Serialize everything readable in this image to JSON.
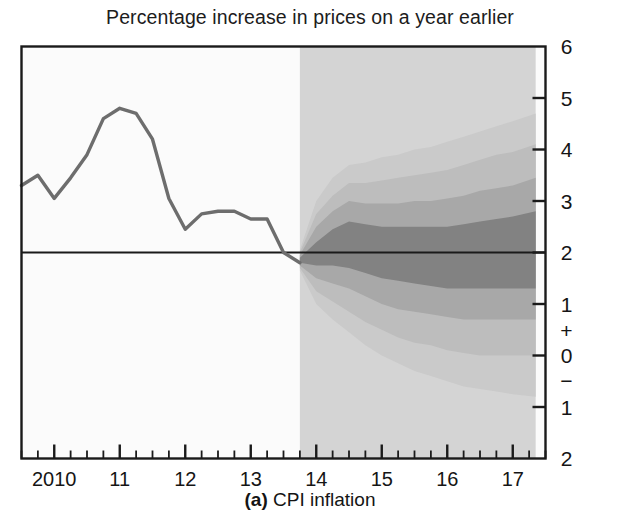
{
  "chart_title": "Percentage increase in prices on a year earlier",
  "caption": {
    "letter": "(a)",
    "label": "CPI inflation"
  },
  "colors": {
    "frame": "#1a1a1a",
    "history_line": "#6d6d6d",
    "target_line": "#1a1a1a",
    "forecast_bg": "#d4d4d4",
    "band_1": "#828282",
    "band_2": "#a8a8a8",
    "band_3": "#bdbdbd",
    "band_4": "#cacaca",
    "band_5": "#d2d2d2",
    "plot_bg": "#fbfbfb"
  },
  "chart_data": {
    "type": "area",
    "title": "Percentage increase in prices on a year earlier",
    "subtitle": "(a) CPI inflation",
    "xlabel": "",
    "ylabel": "",
    "grid": false,
    "legend": "none",
    "ylim": [
      -2,
      6
    ],
    "xlim": [
      2009.5,
      2017.5
    ],
    "ytick_labels": [
      "6",
      "5",
      "4",
      "3",
      "2",
      "1",
      "+",
      "0",
      "−",
      "1",
      "2"
    ],
    "ytick_values": [
      6,
      5,
      4,
      3,
      2,
      1,
      null,
      0,
      null,
      -1,
      -2
    ],
    "xtick_labels": [
      "2010",
      "11",
      "12",
      "13",
      "14",
      "15",
      "16",
      "17"
    ],
    "xtick_values": [
      2010,
      2011,
      2012,
      2013,
      2014,
      2015,
      2016,
      2017
    ],
    "minor_tick_interval_years": 0.25,
    "target_line_value": 2.0,
    "forecast_start_x": 2013.75,
    "forecast_shade_end_x": 2017.35,
    "history": {
      "name": "CPI inflation (outturn)",
      "x": [
        2009.5,
        2009.75,
        2010.0,
        2010.25,
        2010.5,
        2010.75,
        2011.0,
        2011.25,
        2011.5,
        2011.75,
        2012.0,
        2012.25,
        2012.5,
        2012.75,
        2013.0,
        2013.25,
        2013.5,
        2013.75
      ],
      "y": [
        3.3,
        3.5,
        3.05,
        3.45,
        3.9,
        4.6,
        4.8,
        4.7,
        4.2,
        3.05,
        2.45,
        2.75,
        2.8,
        2.8,
        2.65,
        2.65,
        2.0,
        1.8
      ]
    },
    "fan": {
      "name": "CPI inflation projection (fan)",
      "x": [
        2013.75,
        2014.0,
        2014.25,
        2014.5,
        2014.75,
        2015.0,
        2015.25,
        2015.5,
        2015.75,
        2016.0,
        2016.25,
        2016.5,
        2016.75,
        2017.0,
        2017.35
      ],
      "central": [
        1.85,
        2.0,
        2.1,
        2.15,
        2.1,
        2.05,
        2.0,
        1.95,
        1.95,
        1.95,
        1.95,
        1.95,
        1.95,
        1.95,
        1.95
      ],
      "bands": [
        {
          "probability": "30%",
          "color": "#828282",
          "upper": [
            1.9,
            2.2,
            2.45,
            2.6,
            2.55,
            2.5,
            2.5,
            2.5,
            2.5,
            2.5,
            2.55,
            2.6,
            2.65,
            2.7,
            2.8
          ],
          "lower": [
            1.8,
            1.75,
            1.75,
            1.7,
            1.6,
            1.5,
            1.45,
            1.4,
            1.35,
            1.3,
            1.3,
            1.3,
            1.3,
            1.3,
            1.3
          ]
        },
        {
          "probability": "50%",
          "color": "#a8a8a8",
          "upper": [
            1.95,
            2.5,
            2.8,
            3.0,
            2.95,
            2.95,
            2.95,
            3.0,
            3.0,
            3.05,
            3.1,
            3.2,
            3.25,
            3.3,
            3.45
          ],
          "lower": [
            1.75,
            1.5,
            1.4,
            1.3,
            1.15,
            1.0,
            0.9,
            0.85,
            0.8,
            0.75,
            0.7,
            0.7,
            0.7,
            0.7,
            0.7
          ]
        },
        {
          "probability": "70%",
          "color": "#bdbdbd",
          "upper": [
            2.0,
            2.75,
            3.1,
            3.35,
            3.35,
            3.4,
            3.45,
            3.5,
            3.55,
            3.6,
            3.7,
            3.8,
            3.9,
            3.95,
            4.1
          ],
          "lower": [
            1.7,
            1.25,
            1.05,
            0.85,
            0.65,
            0.5,
            0.35,
            0.25,
            0.2,
            0.1,
            0.05,
            0.0,
            0.0,
            0.0,
            0.0
          ]
        },
        {
          "probability": "90%",
          "color": "#cacaca",
          "upper": [
            2.05,
            3.0,
            3.45,
            3.7,
            3.75,
            3.85,
            3.9,
            4.0,
            4.05,
            4.15,
            4.25,
            4.35,
            4.45,
            4.55,
            4.7
          ],
          "lower": [
            1.65,
            1.0,
            0.7,
            0.45,
            0.2,
            0.0,
            -0.15,
            -0.3,
            -0.4,
            -0.5,
            -0.6,
            -0.65,
            -0.7,
            -0.75,
            -0.8
          ]
        }
      ]
    }
  }
}
